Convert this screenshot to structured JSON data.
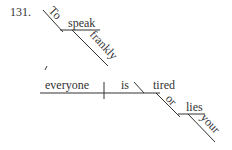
{
  "problem_number": "131.",
  "infinitive_phrase": {
    "preposition": "To",
    "verb": "speak",
    "modifier": "frankly"
  },
  "main_clause": {
    "subject": "everyone",
    "verb": "is",
    "complement": "tired",
    "preposition": "or",
    "object": "lies",
    "object_modifier": "your"
  }
}
